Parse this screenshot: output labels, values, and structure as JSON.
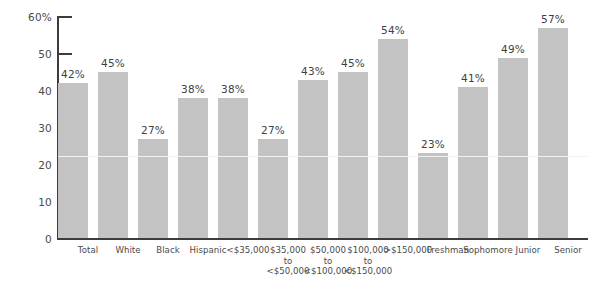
{
  "chart_data": {
    "type": "bar",
    "title": "",
    "xlabel": "",
    "ylabel": "",
    "ylim": [
      0,
      60
    ],
    "yticks": [
      0,
      10,
      20,
      30,
      40,
      50,
      60
    ],
    "ytick_labels": [
      "0",
      "10",
      "20",
      "30",
      "40",
      "50",
      "60%"
    ],
    "grid": false,
    "legend": "none",
    "categories": [
      "Total",
      "White",
      "Black",
      "Hispanic",
      "<$35,000",
      "$35,000\nto\n<$50,000",
      "$50,000\nto\n<$100,000",
      "$100,000\nto\n<$150,000",
      ">$150,000",
      "Freshman",
      "Sophomore",
      "Junior",
      "Senior"
    ],
    "values": [
      42,
      45,
      27,
      38,
      38,
      27,
      43,
      45,
      54,
      23,
      41,
      49,
      57
    ],
    "value_labels": [
      "42%",
      "45%",
      "27%",
      "38%",
      "38%",
      "27%",
      "43%",
      "45%",
      "54%",
      "23%",
      "41%",
      "49%",
      "57%"
    ],
    "bar_color": "#c3c3c3",
    "axis_color": "#3c3c3c",
    "text_color": "#4a4a4a"
  }
}
